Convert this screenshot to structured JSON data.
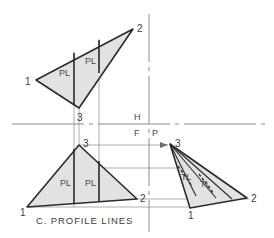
{
  "figure": {
    "caption": "C. PROFILE LINES",
    "colors": {
      "face_fill": "#e2e2e2",
      "outline": "#2b2b2b",
      "projection_line": "#9a9a9a",
      "reference_line": "#8c8c8c",
      "text": "#3c3c3c",
      "background": "#ffffff"
    }
  },
  "reference_lines": {
    "horizontal_y": 124,
    "vertical_x": 149,
    "plane_labels": [
      {
        "text": "H",
        "x": 136,
        "y": 116
      },
      {
        "text": "F",
        "x": 136,
        "y": 134
      },
      {
        "text": "P",
        "x": 152,
        "y": 134
      }
    ]
  },
  "views": [
    {
      "name": "top-view",
      "label": "H",
      "vertices": [
        {
          "id": "1",
          "x": 36,
          "y": 80,
          "label_x": 27,
          "label_y": 84
        },
        {
          "id": "2",
          "x": 133,
          "y": 29,
          "label_x": 138,
          "label_y": 28
        },
        {
          "id": "3",
          "x": 79,
          "y": 108,
          "label_x": 80,
          "label_y": 120
        }
      ],
      "annotations": [
        {
          "text": "PL",
          "x": 66,
          "y": 72,
          "tick_x": 74,
          "tick_y1": 52,
          "tick_y2": 106
        },
        {
          "text": "PL",
          "x": 91,
          "y": 61,
          "tick_x": 99,
          "tick_y1": 39,
          "tick_y2": 74
        }
      ]
    },
    {
      "name": "front-view",
      "label": "F",
      "vertices": [
        {
          "id": "3",
          "x": 79,
          "y": 145,
          "label_x": 84,
          "label_y": 144
        },
        {
          "id": "1",
          "x": 27,
          "y": 207,
          "label_x": 22,
          "label_y": 213
        },
        {
          "id": "2",
          "x": 137,
          "y": 199,
          "label_x": 140,
          "label_y": 199
        }
      ],
      "annotations": [
        {
          "text": "PL",
          "x": 66,
          "y": 183,
          "tick_x": 74,
          "tick_y1": 147,
          "tick_y2": 203
        },
        {
          "text": "PL",
          "x": 91,
          "y": 183,
          "tick_x": 99,
          "tick_y1": 160,
          "tick_y2": 201
        }
      ]
    },
    {
      "name": "profile-view",
      "label": "P",
      "vertices": [
        {
          "id": "3",
          "x": 170,
          "y": 144,
          "label_x": 175,
          "label_y": 144
        },
        {
          "id": "1",
          "x": 190,
          "y": 208,
          "label_x": 190,
          "label_y": 216
        },
        {
          "id": "2",
          "x": 247,
          "y": 198,
          "label_x": 251,
          "label_y": 199
        }
      ],
      "annotations": [
        {
          "text": "TL",
          "x": 186,
          "y": 180,
          "tick_x1": 178,
          "tick_y1": 168,
          "tick_x2": 196,
          "tick_y2": 192
        },
        {
          "text": "TL",
          "x": 205,
          "y": 186,
          "tick_x1": 197,
          "tick_y1": 174,
          "tick_x2": 215,
          "tick_y2": 196
        }
      ]
    }
  ],
  "projection_lines": [
    {
      "name": "vertical-3",
      "x1": 79,
      "y1": 108,
      "x2": 79,
      "y2": 145
    },
    {
      "name": "vertical-pl-a",
      "x1": 74,
      "y1": 52,
      "x2": 74,
      "y2": 205
    },
    {
      "name": "vertical-pl-b",
      "x1": 99,
      "y1": 39,
      "x2": 99,
      "y2": 201
    },
    {
      "name": "horizontal-3-to-profile",
      "x1": 79,
      "y1": 145,
      "x2": 170,
      "y2": 145
    },
    {
      "name": "horizontal-mid",
      "x1": 99,
      "y1": 168,
      "x2": 196,
      "y2": 168
    },
    {
      "name": "horizontal-2",
      "x1": 137,
      "y1": 199,
      "x2": 247,
      "y2": 199
    },
    {
      "name": "horizontal-1",
      "x1": 27,
      "y1": 207,
      "x2": 190,
      "y2": 207
    }
  ]
}
